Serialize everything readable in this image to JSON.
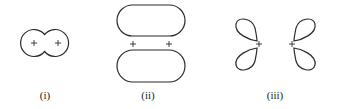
{
  "diagram": {
    "panels": [
      {
        "id": "i",
        "label": "(i)",
        "description": "two overlapping s orbitals (sigma bond)",
        "signs": [
          "+",
          "+"
        ]
      },
      {
        "id": "ii",
        "label": "(ii)",
        "description": "two p orbitals side-by-side (pi-type lobes above and below)",
        "signs": [
          "+",
          "+"
        ]
      },
      {
        "id": "iii",
        "label": "(iii)",
        "description": "two d-type lobe pairs facing each other",
        "signs": [
          "+",
          "+"
        ]
      }
    ]
  }
}
